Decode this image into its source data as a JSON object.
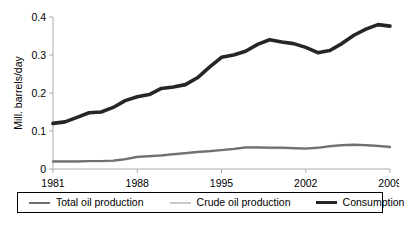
{
  "chart_data": {
    "type": "line",
    "title": "",
    "subtitle": "",
    "xlabel": "",
    "ylabel": "Mill. barrels/day",
    "xlim": [
      1981,
      2009
    ],
    "ylim": [
      0,
      0.4
    ],
    "grid": false,
    "legend_position": "bottom",
    "x_ticks": [
      "1981",
      "1988",
      "1995",
      "2002",
      "2009"
    ],
    "x_tick_values": [
      1981,
      1988,
      1995,
      2002,
      2009
    ],
    "y_ticks": [
      "0",
      "0.1",
      "0.2",
      "0.3",
      "0.4"
    ],
    "y_tick_values": [
      0,
      0.1,
      0.2,
      0.3,
      0.4
    ],
    "x": [
      1981,
      1982,
      1983,
      1984,
      1985,
      1986,
      1987,
      1988,
      1989,
      1990,
      1991,
      1992,
      1993,
      1994,
      1995,
      1996,
      1997,
      1998,
      1999,
      2000,
      2001,
      2002,
      2003,
      2004,
      2005,
      2006,
      2007,
      2008,
      2009
    ],
    "series": [
      {
        "name": "Total oil production",
        "color": "#6f6f6f",
        "width": 2.2,
        "values": [
          0.02,
          0.02,
          0.02,
          0.021,
          0.021,
          0.022,
          0.026,
          0.032,
          0.034,
          0.036,
          0.039,
          0.042,
          0.045,
          0.047,
          0.05,
          0.053,
          0.057,
          0.057,
          0.056,
          0.056,
          0.055,
          0.054,
          0.056,
          0.06,
          0.063,
          0.064,
          0.063,
          0.061,
          0.058
        ]
      },
      {
        "name": "Crude oil production",
        "color": "#c9c9c9",
        "width": 2.2,
        "values": [
          0.019,
          0.019,
          0.019,
          0.02,
          0.02,
          0.021,
          0.025,
          0.031,
          0.033,
          0.035,
          0.038,
          0.041,
          0.044,
          0.046,
          0.049,
          0.052,
          0.056,
          0.056,
          0.055,
          0.055,
          0.054,
          0.053,
          0.055,
          0.059,
          0.062,
          0.063,
          0.062,
          0.06,
          0.057
        ]
      },
      {
        "name": "Consumption",
        "color": "#262626",
        "width": 3.6,
        "values": [
          0.12,
          0.124,
          0.136,
          0.148,
          0.15,
          0.162,
          0.18,
          0.19,
          0.196,
          0.212,
          0.216,
          0.222,
          0.24,
          0.268,
          0.294,
          0.3,
          0.31,
          0.328,
          0.34,
          0.334,
          0.33,
          0.32,
          0.306,
          0.312,
          0.33,
          0.352,
          0.368,
          0.38,
          0.376
        ]
      }
    ]
  },
  "legend": {
    "items": [
      {
        "label": "Total oil production",
        "color": "#6f6f6f",
        "width": 2.4
      },
      {
        "label": "Crude oil production",
        "color": "#c9c9c9",
        "width": 2.4
      },
      {
        "label": "Consumption",
        "color": "#262626",
        "width": 3.6
      }
    ]
  },
  "axes": {
    "axis_color": "#aaaaaa",
    "tick_color": "#aaaaaa"
  }
}
